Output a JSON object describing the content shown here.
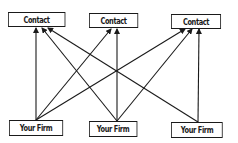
{
  "diagram": {
    "type": "network",
    "nodes": {
      "contacts": [
        {
          "id": "contact-1",
          "label": "Contact",
          "x": 8,
          "y": 12,
          "w": 57,
          "h": 15
        },
        {
          "id": "contact-2",
          "label": "Contact",
          "x": 89,
          "y": 13,
          "w": 49,
          "h": 15
        },
        {
          "id": "contact-3",
          "label": "Contact",
          "x": 171,
          "y": 14,
          "w": 50,
          "h": 15
        }
      ],
      "firms": [
        {
          "id": "firm-1",
          "label": "Your Firm",
          "x": 9,
          "y": 120,
          "w": 54,
          "h": 16
        },
        {
          "id": "firm-2",
          "label": "Your Firm",
          "x": 89,
          "y": 121,
          "w": 48,
          "h": 16
        },
        {
          "id": "firm-3",
          "label": "Your Firm",
          "x": 171,
          "y": 122,
          "w": 52,
          "h": 16
        }
      ]
    },
    "edges": [
      {
        "from": "firm-1",
        "to": "contact-1",
        "x1": 36,
        "y1": 120,
        "x2": 36,
        "y2": 28
      },
      {
        "from": "firm-1",
        "to": "contact-2",
        "x1": 36,
        "y1": 120,
        "x2": 111,
        "y2": 29
      },
      {
        "from": "firm-1",
        "to": "contact-3",
        "x1": 36,
        "y1": 120,
        "x2": 185,
        "y2": 29
      },
      {
        "from": "firm-2",
        "to": "contact-1",
        "x1": 117,
        "y1": 121,
        "x2": 42,
        "y2": 28
      },
      {
        "from": "firm-2",
        "to": "contact-2",
        "x1": 117,
        "y1": 121,
        "x2": 117,
        "y2": 29
      },
      {
        "from": "firm-2",
        "to": "contact-3",
        "x1": 117,
        "y1": 121,
        "x2": 192,
        "y2": 29
      },
      {
        "from": "firm-3",
        "to": "contact-1",
        "x1": 198,
        "y1": 122,
        "x2": 48,
        "y2": 28
      },
      {
        "from": "firm-3",
        "to": "contact-3",
        "x1": 198,
        "y1": 122,
        "x2": 199,
        "y2": 29
      }
    ],
    "colors": {
      "line": "#1a1a1a",
      "box_border": "#1a1a1a",
      "background": "#ffffff"
    }
  }
}
